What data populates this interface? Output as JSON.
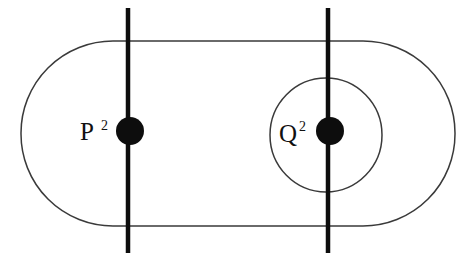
{
  "figure": {
    "background_color": "#ffffff",
    "outline_color": "#3a3a3a",
    "mark_color": "#000000",
    "label_color": "#111111"
  },
  "outer_region": {
    "name": "outer-stadium-boundary",
    "shape": "stadium",
    "left": 21,
    "top": 41,
    "right": 455,
    "bottom": 226,
    "corner_radius": 92,
    "stroke_width": 1.5,
    "stroke_color": "#3a3a3a",
    "fill": "none"
  },
  "inner_region": {
    "name": "inner-ellipse-boundary",
    "shape": "ellipse",
    "center_x": 326,
    "center_y": 135,
    "radius_x": 56,
    "radius_y": 57,
    "stroke_width": 1.5,
    "stroke_color": "#3a3a3a",
    "fill": "none"
  },
  "vertical_lines": [
    {
      "name": "vertical-line-left",
      "x": 128,
      "y_top": 8,
      "y_bottom": 253,
      "stroke_width": 4.5,
      "stroke_color": "#0d0d0d"
    },
    {
      "name": "vertical-line-right",
      "x": 328,
      "y_top": 8,
      "y_bottom": 253,
      "stroke_width": 4.5,
      "stroke_color": "#0d0d0d"
    }
  ],
  "nodes": [
    {
      "name": "node-p",
      "label": "P",
      "superscript": "2",
      "label_x": 80,
      "label_y": 140,
      "superscript_x": 101,
      "superscript_y": 130,
      "dot_center_x": 130,
      "dot_center_y": 131,
      "dot_radius": 14,
      "dot_color": "#0d0d0d"
    },
    {
      "name": "node-q",
      "label": "Q",
      "superscript": "2",
      "label_x": 279,
      "label_y": 142,
      "superscript_x": 299,
      "superscript_y": 131,
      "dot_center_x": 330,
      "dot_center_y": 131,
      "dot_radius": 14,
      "dot_color": "#0d0d0d"
    }
  ]
}
